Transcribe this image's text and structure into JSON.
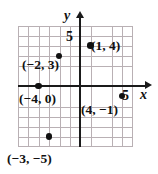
{
  "figure": {
    "name": "coordinate-plane-plotted-points",
    "axes": {
      "x_axis_label": "x",
      "y_axis_label": "y",
      "x_tick_label": "5",
      "y_tick_label": "5"
    },
    "points": [
      {
        "id": "p1",
        "label": "(−2, 3)",
        "x": -2,
        "y": 3
      },
      {
        "id": "p2",
        "label": "(1, 4)",
        "x": 1,
        "y": 4
      },
      {
        "id": "p3",
        "label": "(−4, 0)",
        "x": -4,
        "y": 0
      },
      {
        "id": "p4",
        "label": "(4, −1)",
        "x": 4,
        "y": -1
      },
      {
        "id": "p5",
        "label": "(−3, −5)",
        "x": -3,
        "y": -5
      }
    ]
  },
  "chart_data": {
    "type": "scatter",
    "title": "",
    "xlabel": "x",
    "ylabel": "y",
    "xlim": [
      -6,
      5
    ],
    "ylim": [
      -6,
      6
    ],
    "grid": true,
    "legend": "none",
    "x_ticks": [
      5
    ],
    "y_ticks": [
      5
    ],
    "points": [
      {
        "x": -2,
        "y": 3,
        "label": "(−2, 3)"
      },
      {
        "x": 1,
        "y": 4,
        "label": "(1, 4)"
      },
      {
        "x": -4,
        "y": 0,
        "label": "(−4, 0)"
      },
      {
        "x": 4,
        "y": -1,
        "label": "(4, −1)"
      },
      {
        "x": -3,
        "y": -5,
        "label": "(−3, −5)"
      }
    ]
  }
}
